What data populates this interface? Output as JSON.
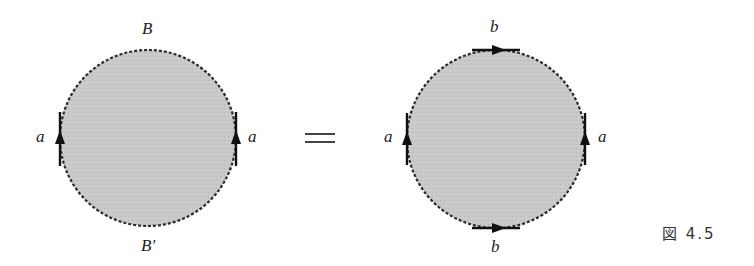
{
  "figure": {
    "caption": "図 4.5",
    "equals_sign": "="
  },
  "left_diagram": {
    "top_label": "B",
    "bottom_label": "B′",
    "left_label": "a",
    "right_label": "a",
    "arrows": [
      "left-edge-up",
      "right-edge-up"
    ]
  },
  "right_diagram": {
    "top_label": "b",
    "bottom_label": "b",
    "left_label": "a",
    "right_label": "a",
    "arrows": [
      "top-edge-right",
      "bottom-edge-right",
      "left-edge-up",
      "right-edge-up"
    ]
  },
  "colors": {
    "fill": "#c8c8c8",
    "stroke": "#2a2a2a",
    "text": "#222222"
  }
}
